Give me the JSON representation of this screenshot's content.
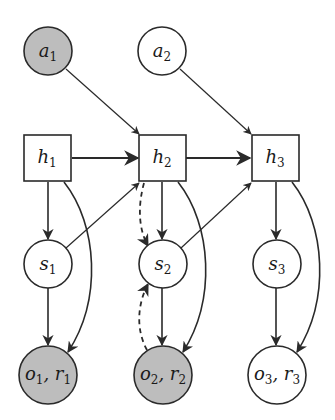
{
  "diagram": {
    "type": "graphical-model",
    "colors": {
      "observed_fill": "#bdbdbd",
      "latent_fill": "#ffffff",
      "stroke": "#2a2a2a"
    },
    "nodes": {
      "a1": {
        "base": "a",
        "sub": "1",
        "shape": "circle",
        "observed": true
      },
      "a2": {
        "base": "a",
        "sub": "2",
        "shape": "circle",
        "observed": false
      },
      "h1": {
        "base": "h",
        "sub": "1",
        "shape": "square"
      },
      "h2": {
        "base": "h",
        "sub": "2",
        "shape": "square"
      },
      "h3": {
        "base": "h",
        "sub": "3",
        "shape": "square"
      },
      "s1": {
        "base": "s",
        "sub": "1",
        "shape": "circle",
        "observed": false
      },
      "s2": {
        "base": "s",
        "sub": "2",
        "shape": "circle",
        "observed": false
      },
      "s3": {
        "base": "s",
        "sub": "3",
        "shape": "circle",
        "observed": false
      },
      "o1": {
        "base1": "o",
        "sub1": "1",
        "sep": ", ",
        "base2": "r",
        "sub2": "1",
        "shape": "circle",
        "observed": true
      },
      "o2": {
        "base1": "o",
        "sub1": "2",
        "sep": ", ",
        "base2": "r",
        "sub2": "2",
        "shape": "circle",
        "observed": true
      },
      "o3": {
        "base1": "o",
        "sub1": "3",
        "sep": ", ",
        "base2": "r",
        "sub2": "3",
        "shape": "circle",
        "observed": false
      }
    },
    "edges": [
      {
        "from": "a1",
        "to": "h2",
        "style": "solid"
      },
      {
        "from": "a2",
        "to": "h3",
        "style": "solid"
      },
      {
        "from": "h1",
        "to": "h2",
        "style": "solid"
      },
      {
        "from": "h2",
        "to": "h3",
        "style": "solid"
      },
      {
        "from": "h1",
        "to": "s1",
        "style": "solid"
      },
      {
        "from": "h2",
        "to": "s2",
        "style": "solid"
      },
      {
        "from": "h3",
        "to": "s3",
        "style": "solid"
      },
      {
        "from": "s1",
        "to": "h2",
        "style": "solid"
      },
      {
        "from": "s2",
        "to": "h3",
        "style": "solid"
      },
      {
        "from": "s1",
        "to": "o1",
        "style": "solid"
      },
      {
        "from": "s2",
        "to": "o2",
        "style": "solid"
      },
      {
        "from": "s3",
        "to": "o3",
        "style": "solid"
      },
      {
        "from": "h1",
        "to": "o1",
        "style": "solid-curved"
      },
      {
        "from": "h2",
        "to": "o2",
        "style": "solid-curved"
      },
      {
        "from": "h3",
        "to": "o3",
        "style": "solid-curved"
      },
      {
        "from": "h2",
        "to": "s2",
        "style": "dashed-curved"
      },
      {
        "from": "o2",
        "to": "s2",
        "style": "dashed-curved"
      }
    ]
  }
}
